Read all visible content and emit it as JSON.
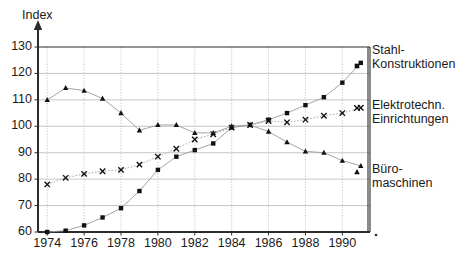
{
  "chart_data": {
    "type": "scatter",
    "title": "",
    "ylabel": "Index",
    "xlabel": "",
    "ylim": [
      60,
      130
    ],
    "xlim": [
      1973.5,
      1991.5
    ],
    "yticks": [
      60,
      70,
      80,
      90,
      100,
      110,
      120,
      130
    ],
    "xticks": [
      1974,
      1976,
      1978,
      1980,
      1982,
      1984,
      1986,
      1988,
      1990
    ],
    "grid": true,
    "legend_position": "right-outside",
    "x": [
      1974,
      1975,
      1976,
      1977,
      1978,
      1979,
      1980,
      1981,
      1982,
      1983,
      1984,
      1985,
      1986,
      1987,
      1988,
      1989,
      1990,
      1991
    ],
    "series": [
      {
        "name": "Stahl-Konstruktionen",
        "marker": "square",
        "values": [
          60,
          60.5,
          62.5,
          65.5,
          69,
          75.5,
          83.5,
          88.5,
          91,
          93.5,
          99.5,
          100.5,
          102.5,
          105,
          108,
          111,
          116.5,
          124
        ]
      },
      {
        "name": "Elektrotechn. Einrichtungen",
        "marker": "cross",
        "values": [
          78,
          80.5,
          82,
          83,
          83.5,
          85.5,
          88.5,
          91.5,
          95,
          97,
          99.5,
          100.5,
          102,
          101.5,
          102.5,
          104,
          105,
          107
        ]
      },
      {
        "name": "Büromaschinen",
        "marker": "triangle",
        "values": [
          110,
          114.5,
          113.5,
          110.5,
          105,
          98.5,
          100.5,
          100.5,
          97.5,
          97.5,
          100,
          100.5,
          98,
          94,
          90.5,
          90,
          87,
          85
        ]
      }
    ]
  },
  "legend": {
    "items": [
      {
        "label_line1": "Stahl-",
        "label_line2": "Konstruktionen",
        "marker": "square"
      },
      {
        "label_line1": "Elektrotechn.",
        "label_line2": "Einrichtungen",
        "marker": "cross"
      },
      {
        "label_line1": "Büro-",
        "label_line2": "maschinen",
        "marker": "triangle"
      }
    ]
  },
  "colors": {
    "ink": "#111111",
    "grid": "#b8b8b8",
    "frame": "#2b2b2b",
    "background": "#ffffff"
  }
}
